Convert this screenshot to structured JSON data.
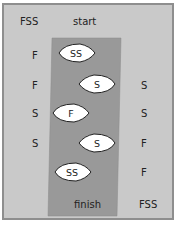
{
  "diagram": {
    "top_left": "FSS",
    "top_center": "start",
    "bottom_center": "finish",
    "bottom_right": "FSS",
    "left_bank": [
      "F",
      "F",
      "S",
      "S"
    ],
    "right_bank": [
      "S",
      "S",
      "F",
      "F"
    ],
    "boats": [
      {
        "label": "SS",
        "direction": "right"
      },
      {
        "label": "S",
        "direction": "left"
      },
      {
        "label": "F",
        "direction": "right"
      },
      {
        "label": "S",
        "direction": "left"
      },
      {
        "label": "SS",
        "direction": "right"
      }
    ],
    "colors": {
      "background": "#c9c9c9",
      "border": "#8e8e8e",
      "river": "#999999",
      "boat": "#ffffff",
      "text": "#222222"
    }
  }
}
